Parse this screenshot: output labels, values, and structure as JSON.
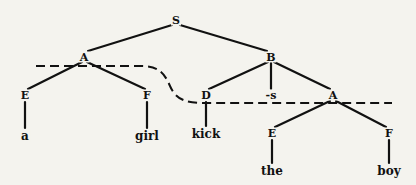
{
  "diagram": {
    "type": "syntax-tree",
    "nodes": [
      {
        "id": "S",
        "label": "S",
        "x": 176,
        "y": 20
      },
      {
        "id": "A1",
        "label": "A",
        "x": 84,
        "y": 57
      },
      {
        "id": "B",
        "label": "B",
        "x": 271,
        "y": 57
      },
      {
        "id": "E1",
        "label": "E",
        "x": 25,
        "y": 95
      },
      {
        "id": "F1",
        "label": "F",
        "x": 147,
        "y": 95
      },
      {
        "id": "D",
        "label": "D",
        "x": 206,
        "y": 95
      },
      {
        "id": "s",
        "label": "-s",
        "x": 271,
        "y": 95
      },
      {
        "id": "A2",
        "label": "A",
        "x": 333,
        "y": 95
      },
      {
        "id": "a",
        "label": "a",
        "x": 25,
        "y": 136
      },
      {
        "id": "girl",
        "label": "girl",
        "x": 147,
        "y": 136
      },
      {
        "id": "kick",
        "label": "kick",
        "x": 206,
        "y": 134
      },
      {
        "id": "E2",
        "label": "E",
        "x": 272,
        "y": 133
      },
      {
        "id": "F2",
        "label": "F",
        "x": 389,
        "y": 133
      },
      {
        "id": "the",
        "label": "the",
        "x": 272,
        "y": 171
      },
      {
        "id": "boy",
        "label": "boy",
        "x": 389,
        "y": 171
      }
    ],
    "edges": [
      [
        "S",
        "A1"
      ],
      [
        "S",
        "B"
      ],
      [
        "A1",
        "E1"
      ],
      [
        "A1",
        "F1"
      ],
      [
        "B",
        "D"
      ],
      [
        "B",
        "s"
      ],
      [
        "B",
        "A2"
      ],
      [
        "E1",
        "a"
      ],
      [
        "F1",
        "girl"
      ],
      [
        "D",
        "kick"
      ],
      [
        "A2",
        "E2"
      ],
      [
        "A2",
        "F2"
      ],
      [
        "E2",
        "the"
      ],
      [
        "F2",
        "boy"
      ]
    ],
    "dashed_boundary": "constituent boundary line passing through A (left) and curving down through D to A (right)"
  }
}
